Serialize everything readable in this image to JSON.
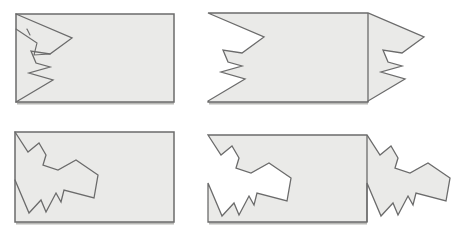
{
  "canvas": {
    "width": 455,
    "height": 236,
    "background": "#ffffff"
  },
  "style": {
    "shape_fill": "#eaeae8",
    "line_color": "#6b6b6b",
    "line_width": 1.3,
    "edge_width": 1.5,
    "shadow_color": "#b9b9b6",
    "shadow_width": 2.2
  },
  "panels": [
    {
      "id": "top-left-rect-with-tear",
      "type": "rect-with-tear",
      "x": 16,
      "y": 14,
      "w": 158,
      "h": 88,
      "tear": [
        [
          0,
          0
        ],
        [
          56,
          24
        ],
        [
          34,
          40
        ],
        [
          15,
          37
        ],
        [
          20,
          49
        ],
        [
          34,
          53
        ],
        [
          13,
          59
        ],
        [
          37,
          66
        ],
        [
          0,
          88
        ]
      ],
      "sketch_lines": [
        [
          [
            0,
            15
          ],
          [
            21,
            29
          ],
          [
            18,
            41
          ],
          [
            34,
            40
          ]
        ],
        [
          [
            11,
            15
          ],
          [
            14,
            21
          ]
        ]
      ]
    },
    {
      "id": "top-right-torn-shifted",
      "type": "torn-shifted",
      "x": 208,
      "y": 13,
      "w": 160,
      "h": 89,
      "tear": [
        [
          0,
          0
        ],
        [
          56,
          24
        ],
        [
          34,
          40
        ],
        [
          15,
          37
        ],
        [
          20,
          49
        ],
        [
          34,
          53
        ],
        [
          13,
          59
        ],
        [
          37,
          66
        ],
        [
          0,
          88
        ]
      ]
    },
    {
      "id": "bottom-left-rect-with-tear",
      "type": "rect-with-tear",
      "x": 15,
      "y": 132,
      "w": 159,
      "h": 90,
      "tear": [
        [
          0,
          0
        ],
        [
          13,
          20
        ],
        [
          24,
          11
        ],
        [
          31,
          23
        ],
        [
          28,
          33
        ],
        [
          43,
          38
        ],
        [
          61,
          28
        ],
        [
          83,
          43
        ],
        [
          79,
          66
        ],
        [
          49,
          58
        ],
        [
          46,
          70
        ],
        [
          41,
          61
        ],
        [
          31,
          80
        ],
        [
          26,
          68
        ],
        [
          14,
          81
        ],
        [
          0,
          48
        ]
      ],
      "sketch_lines": []
    },
    {
      "id": "bottom-right-torn-shifted",
      "type": "torn-shifted",
      "x": 208,
      "y": 135,
      "w": 159,
      "h": 87,
      "tear": [
        [
          0,
          0
        ],
        [
          13,
          20
        ],
        [
          24,
          11
        ],
        [
          31,
          23
        ],
        [
          28,
          33
        ],
        [
          43,
          38
        ],
        [
          61,
          28
        ],
        [
          83,
          43
        ],
        [
          79,
          66
        ],
        [
          49,
          58
        ],
        [
          46,
          70
        ],
        [
          41,
          61
        ],
        [
          31,
          80
        ],
        [
          26,
          68
        ],
        [
          14,
          81
        ],
        [
          0,
          48
        ]
      ]
    }
  ]
}
